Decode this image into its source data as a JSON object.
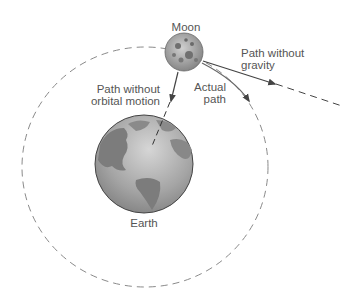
{
  "diagram": {
    "labels": {
      "moon": "Moon",
      "earth": "Earth",
      "path_without_gravity": [
        "Path without",
        "gravity"
      ],
      "path_without_orbital_motion": [
        "Path without",
        "orbital motion"
      ],
      "actual_path": [
        "Actual",
        "path"
      ]
    },
    "colors": {
      "orbit_dash": "#8a8a8a",
      "arrow": "#444444",
      "label_text": "#555555",
      "earth_ocean": "#a9a9a9",
      "earth_land": "#7c7c7c",
      "moon": "#9a9a9a"
    }
  }
}
